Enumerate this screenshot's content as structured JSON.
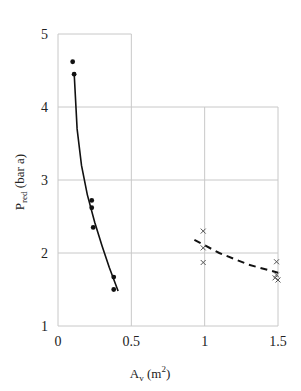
{
  "chart_data": {
    "type": "scatter",
    "title": "",
    "xlabel": "A_v (m²)",
    "xlabel_main": "A",
    "xlabel_sub": "v",
    "xlabel_unit": " (m",
    "xlabel_sup": "2",
    "xlabel_close": ")",
    "ylabel": "P_red (bar a)",
    "ylabel_main": "P",
    "ylabel_sub": "red",
    "ylabel_unit": " (bar a)",
    "xlim": [
      0,
      1.5
    ],
    "ylim": [
      1,
      5
    ],
    "x_ticks": [
      "0",
      "0.5",
      "1",
      "1.5"
    ],
    "y_ticks": [
      "1",
      "2",
      "3",
      "4",
      "5"
    ],
    "grid": true,
    "legend": "none",
    "series": [
      {
        "name": "filled-dots",
        "marker": "dot",
        "fit": "solid-curve",
        "points": [
          {
            "x": 0.1,
            "y": 4.62
          },
          {
            "x": 0.11,
            "y": 4.45
          },
          {
            "x": 0.23,
            "y": 2.72
          },
          {
            "x": 0.23,
            "y": 2.62
          },
          {
            "x": 0.24,
            "y": 2.35
          },
          {
            "x": 0.38,
            "y": 1.67
          },
          {
            "x": 0.38,
            "y": 1.5
          }
        ],
        "curve": [
          {
            "x": 0.11,
            "y": 4.48
          },
          {
            "x": 0.13,
            "y": 3.7
          },
          {
            "x": 0.16,
            "y": 3.2
          },
          {
            "x": 0.2,
            "y": 2.8
          },
          {
            "x": 0.25,
            "y": 2.42
          },
          {
            "x": 0.3,
            "y": 2.1
          },
          {
            "x": 0.35,
            "y": 1.8
          },
          {
            "x": 0.41,
            "y": 1.48
          }
        ]
      },
      {
        "name": "crosses",
        "marker": "x",
        "fit": "dashed-curve",
        "points": [
          {
            "x": 0.99,
            "y": 2.3
          },
          {
            "x": 0.99,
            "y": 2.07
          },
          {
            "x": 0.99,
            "y": 1.87
          },
          {
            "x": 1.49,
            "y": 1.88
          },
          {
            "x": 1.49,
            "y": 1.7
          },
          {
            "x": 1.48,
            "y": 1.66
          },
          {
            "x": 1.5,
            "y": 1.63
          }
        ],
        "curve": [
          {
            "x": 0.93,
            "y": 2.18
          },
          {
            "x": 1.1,
            "y": 2.0
          },
          {
            "x": 1.3,
            "y": 1.84
          },
          {
            "x": 1.5,
            "y": 1.73
          }
        ]
      }
    ]
  }
}
